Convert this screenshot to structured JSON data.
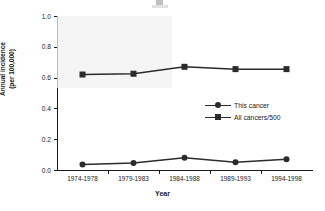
{
  "chart_data": {
    "type": "line",
    "title": "",
    "xlabel": "Year",
    "ylabel": "Annual incidence (per 100,000)",
    "ylabel_line1": "Annual incidence",
    "ylabel_line2": "(per 100,000)",
    "categories": [
      "1974-1978",
      "1979-1983",
      "1984-1988",
      "1989-1993",
      "1994-1998"
    ],
    "series": [
      {
        "name": "This cancer",
        "marker": "circle",
        "color": "#2b2b2b",
        "values": [
          0.035,
          0.045,
          0.08,
          0.05,
          0.07
        ]
      },
      {
        "name": "All cancers/500",
        "marker": "square",
        "color": "#2b2b2b",
        "values": [
          0.62,
          0.625,
          0.67,
          0.655,
          0.655
        ]
      }
    ],
    "ylim": [
      0.0,
      1.0
    ],
    "yticks": [
      "0.0",
      "0.2",
      "0.4",
      "0.6",
      "0.8",
      "1.0"
    ],
    "ytick_values": [
      0.0,
      0.2,
      0.4,
      0.6,
      0.8,
      1.0
    ],
    "grid": false,
    "legend_position": "center-right"
  }
}
